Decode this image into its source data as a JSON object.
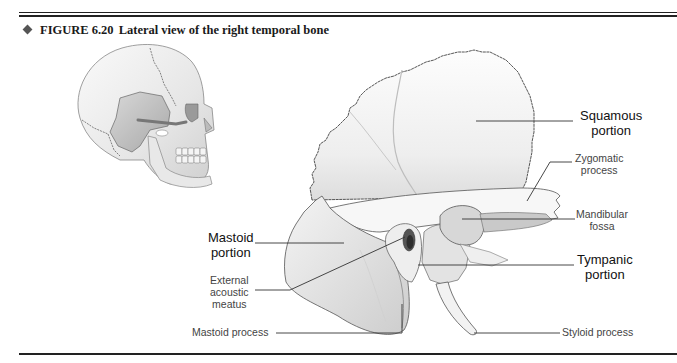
{
  "figure": {
    "number": "FIGURE 6.20",
    "title": "Lateral view of the right temporal bone",
    "bullet_color": "#555555",
    "rule_color": "#222222"
  },
  "labels": {
    "squamous_portion": {
      "line1": "Squamous",
      "line2": "portion"
    },
    "zygomatic_process": {
      "line1": "Zygomatic",
      "line2": "process"
    },
    "mandibular_fossa": {
      "line1": "Mandibular",
      "line2": "fossa"
    },
    "tympanic_portion": {
      "line1": "Tympanic",
      "line2": "portion"
    },
    "mastoid_portion": {
      "line1": "Mastoid",
      "line2": "portion"
    },
    "external_acoustic_meatus": {
      "line1": "External",
      "line2": "acoustic",
      "line3": "meatus"
    },
    "mastoid_process": {
      "text": "Mastoid process"
    },
    "styloid_process": {
      "text": "Styloid process"
    }
  },
  "illustrations": {
    "skull": "inset-lateral-skull-with-temporal-bone-highlighted",
    "bone": "right-temporal-bone-lateral-view"
  }
}
